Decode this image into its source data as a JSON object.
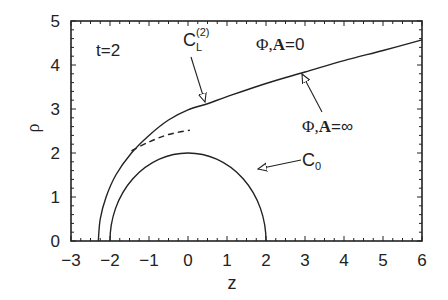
{
  "chart_data": {
    "type": "line",
    "title": "",
    "xlabel": "z",
    "ylabel": "ρ",
    "xlim": [
      -3,
      6
    ],
    "ylim": [
      0,
      5
    ],
    "grid": false,
    "legend": "none",
    "x_ticks": [
      -3,
      -2,
      -1,
      0,
      1,
      2,
      3,
      4,
      5,
      6
    ],
    "y_ticks": [
      0,
      1,
      2,
      3,
      4,
      5
    ],
    "x_tick_labels": [
      "−3",
      "−2",
      "−1",
      "0",
      "1",
      "2",
      "3",
      "4",
      "5",
      "6"
    ],
    "y_tick_labels": [
      "0",
      "1",
      "2",
      "3",
      "4",
      "5"
    ],
    "series": [
      {
        "name": "C_L^(2) (Φ,A=∞ boundary)",
        "style": "solid",
        "points": [
          [
            -2.3,
            0
          ],
          [
            -2.25,
            0.5
          ],
          [
            -2.1,
            1.0
          ],
          [
            -1.85,
            1.5
          ],
          [
            -1.45,
            2.0
          ],
          [
            -1.0,
            2.4
          ],
          [
            -0.5,
            2.75
          ],
          [
            0.0,
            2.98
          ],
          [
            0.5,
            3.12
          ],
          [
            1.0,
            3.28
          ],
          [
            2.0,
            3.58
          ],
          [
            3.0,
            3.84
          ],
          [
            4.0,
            4.1
          ],
          [
            5.0,
            4.33
          ],
          [
            6.0,
            4.57
          ]
        ]
      },
      {
        "name": "dashed branch",
        "style": "dashed",
        "points": [
          [
            -1.45,
            2.05
          ],
          [
            -1.0,
            2.25
          ],
          [
            -0.5,
            2.42
          ],
          [
            0.05,
            2.52
          ]
        ]
      },
      {
        "name": "C_0",
        "style": "solid",
        "shape": "semicircle",
        "center": [
          0,
          0
        ],
        "radius": 2
      }
    ],
    "annotations": [
      {
        "text": "t=2",
        "x": -2.2,
        "y": 4.2
      },
      {
        "text": "C_L^(2)",
        "x": -0.2,
        "y": 4.45,
        "arrow_to": [
          0.45,
          3.1
        ]
      },
      {
        "text": "Φ,A=0",
        "x": 2.6,
        "y": 4.45
      },
      {
        "text": "Φ,A=∞",
        "x": 3.4,
        "y": 2.25,
        "arrow_to": [
          2.95,
          3.82
        ]
      },
      {
        "text": "C_0",
        "x": 3.5,
        "y": 1.92,
        "arrow_to": [
          1.5,
          1.32
        ]
      }
    ]
  },
  "labels": {
    "t_label": "t=2",
    "cl_main": "C",
    "cl_sub": "L",
    "cl_sup": "(2)",
    "phi_zero_phi": "Φ,",
    "phi_zero_A": "A",
    "phi_zero_rest": "=0",
    "phi_inf_phi": "Φ,",
    "phi_inf_A": "A",
    "phi_inf_rest": "=∞",
    "c0_main": "C",
    "c0_sub": "0",
    "xlabel": "z",
    "ylabel": "ρ"
  },
  "colors": {
    "line": "#222222",
    "background": "#ffffff"
  }
}
